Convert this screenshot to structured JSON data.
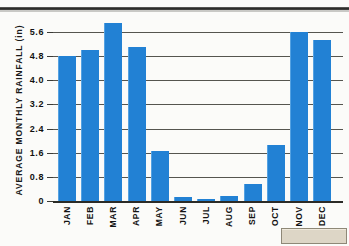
{
  "chart_data": {
    "type": "bar",
    "title": "",
    "xlabel": "",
    "ylabel": "AVERAGE MONTHLY RAINFALL (in)",
    "categories": [
      "JAN",
      "FEB",
      "MAR",
      "APR",
      "MAY",
      "JUN",
      "JUL",
      "AUG",
      "SEP",
      "OCT",
      "NOV",
      "DEC"
    ],
    "values": [
      4.8,
      5.0,
      5.9,
      5.1,
      1.65,
      0.12,
      0.08,
      0.15,
      0.55,
      1.85,
      5.6,
      5.35
    ],
    "ylim": [
      0,
      6.2
    ],
    "ytick_labels": [
      "5.6",
      "4.8",
      "4.0",
      "3.2",
      "2.4",
      "1.6",
      "0.8",
      "0"
    ],
    "ytick_values": [
      5.6,
      4.8,
      4.0,
      3.2,
      2.4,
      1.6,
      0.8,
      0
    ],
    "grid": true,
    "legend": false,
    "bar_color": "#2281d4",
    "axis_color": "#2b2b27"
  },
  "page": {
    "top_rule": "",
    "artifact_label": ""
  }
}
